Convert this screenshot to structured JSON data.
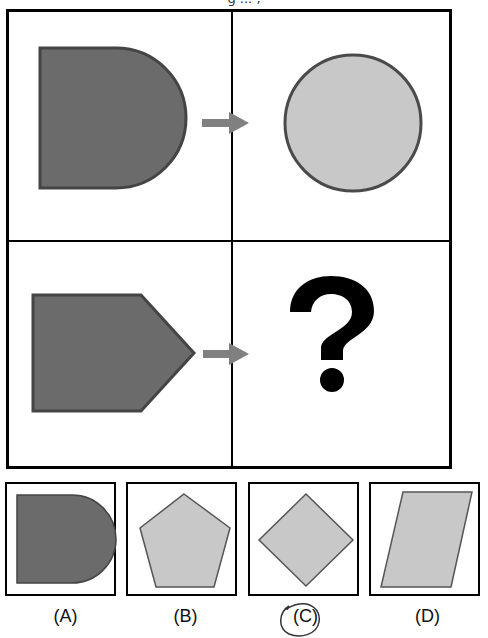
{
  "puzzle": {
    "title_fragment": "g ... ,",
    "matrix": {
      "top_left": {
        "shape": "d-shape",
        "fill": "#6b6b6b",
        "stroke": "#444444"
      },
      "top_arrow": {
        "icon": "arrow-right-icon",
        "color": "#808080"
      },
      "top_right": {
        "shape": "circle",
        "fill": "#c8c8c8",
        "stroke": "#4a4a4a"
      },
      "bottom_left": {
        "shape": "pentagon-arrow",
        "fill": "#6b6b6b",
        "stroke": "#444444"
      },
      "bottom_arrow": {
        "icon": "arrow-right-icon",
        "color": "#808080"
      },
      "bottom_right": {
        "symbol": "?"
      }
    },
    "options": [
      {
        "label": "(A)",
        "shape": "d-shape",
        "fill": "#6b6b6b"
      },
      {
        "label": "(B)",
        "shape": "pentagon",
        "fill": "#c8c8c8"
      },
      {
        "label": "(C)",
        "shape": "diamond",
        "fill": "#c8c8c8",
        "circled": true
      },
      {
        "label": "(D)",
        "shape": "parallelogram",
        "fill": "#c8c8c8"
      }
    ],
    "colors": {
      "dark_fill": "#6b6b6b",
      "light_fill": "#c8c8c8",
      "outline": "#4a4a4a",
      "arrow": "#808080",
      "frame": "#000000"
    }
  }
}
